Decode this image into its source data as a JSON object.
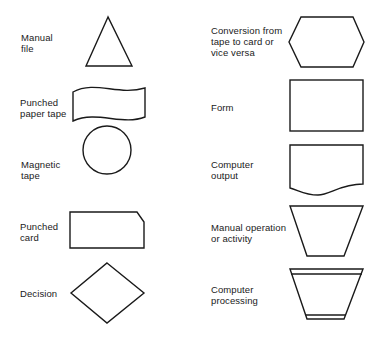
{
  "left_column": [
    {
      "label": "Manual\nfile",
      "shape": "triangle"
    },
    {
      "label": "Punched\npaper tape",
      "shape": "wavy-rectangle"
    },
    {
      "label": "Magnetic\ntape",
      "shape": "circle"
    },
    {
      "label": "Punched\ncard",
      "shape": "cut-corner-rectangle"
    },
    {
      "label": "Decision",
      "shape": "diamond"
    }
  ],
  "right_column": [
    {
      "label": "Conversion from\ntape to card or\nvice versa",
      "shape": "hexagon"
    },
    {
      "label": "Form",
      "shape": "rectangle"
    },
    {
      "label": "Computer\noutput",
      "shape": "document"
    },
    {
      "label": "Manual operation\nor activity",
      "shape": "trapezoid"
    },
    {
      "label": "Computer\nprocessing",
      "shape": "trapezoid-with-bands"
    }
  ]
}
